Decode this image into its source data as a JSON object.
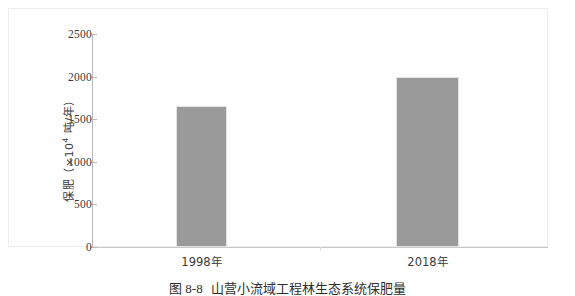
{
  "figure": {
    "caption_number": "图 8-8",
    "caption_text": "山营小流域工程林生态系统保肥量",
    "caption_full": "图 8-8　山营小流域工程林生态系统保肥量"
  },
  "chart_data": {
    "type": "bar",
    "title": "",
    "categories": [
      "1998年",
      "2018年"
    ],
    "values": [
      1650,
      1990
    ],
    "series": [
      {
        "name": "保肥量",
        "values": [
          1650,
          1990
        ]
      }
    ],
    "xlabel": "",
    "ylabel": "保肥（×10⁴ 吨/年）",
    "ylabel_prefix": "保肥（×10",
    "ylabel_exponent": "4",
    "ylabel_suffix": " 吨/年）",
    "ylim": [
      0,
      2500
    ],
    "ytick_values": [
      0,
      500,
      1000,
      1500,
      2000,
      2500
    ],
    "ytick_labels": [
      "0",
      "500",
      "1000",
      "1500",
      "2000",
      "2500"
    ],
    "grid": false,
    "legend": false,
    "bar_color": "#9a9a9a",
    "bar_border_color": "#e2e2e2",
    "axis_color": "#b9b9b9",
    "frame_color": "#ededed",
    "background": "#ffffff"
  },
  "axis": {
    "ticks": [
      {
        "label": "2500",
        "value": 2500
      },
      {
        "label": "2000",
        "value": 2000
      },
      {
        "label": "1500",
        "value": 1500
      },
      {
        "label": "1000",
        "value": 1000
      },
      {
        "label": "500",
        "value": 500
      },
      {
        "label": "0",
        "value": 0
      }
    ]
  },
  "bars": [
    {
      "category": "1998年",
      "value": 1650,
      "left_px": 84,
      "width_px": 51
    },
    {
      "category": "2018年",
      "value": 1990,
      "left_px": 304,
      "width_px": 63
    }
  ]
}
